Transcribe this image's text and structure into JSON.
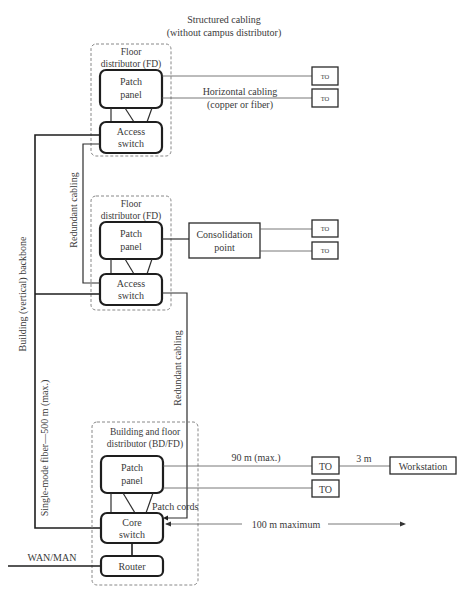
{
  "title": {
    "line1": "Structured cabling",
    "line2": "(without campus distributor)"
  },
  "floor_distributor_top": {
    "label_line1": "Floor",
    "label_line2": "distributor (FD)",
    "patch_panel": [
      "Patch",
      "panel"
    ],
    "switch": [
      "Access",
      "switch"
    ],
    "horizontal_cabling": [
      "Horizontal cabling",
      "(copper or fiber)"
    ],
    "outlets": [
      "TO",
      "TO"
    ]
  },
  "floor_distributor_middle": {
    "label_line1": "Floor",
    "label_line2": "distributor (FD)",
    "patch_panel": [
      "Patch",
      "panel"
    ],
    "switch": [
      "Access",
      "switch"
    ],
    "consolidation_point": [
      "Consolidation",
      "point"
    ],
    "outlets": [
      "TO",
      "TO"
    ]
  },
  "building_distributor": {
    "label_line1": "Building and floor",
    "label_line2": "distributor (BD/FD)",
    "patch_panel": [
      "Patch",
      "panel"
    ],
    "switch": [
      "Core",
      "switch"
    ],
    "router": "Router",
    "patch_cords": "Patch cords",
    "outlets": [
      "TO",
      "TO"
    ],
    "workstation": "Workstation",
    "distance_90": "90 m (max.)",
    "distance_3": "3 m",
    "distance_100": "100 m maximum",
    "wan": "WAN/MAN"
  },
  "vertical_labels": {
    "backbone": "Building (vertical) backbone",
    "fiber": "Single-mode fiber—500 m (max.)",
    "redundant_left": "Redundant cabling",
    "redundant_right": "Redundant cabling"
  }
}
